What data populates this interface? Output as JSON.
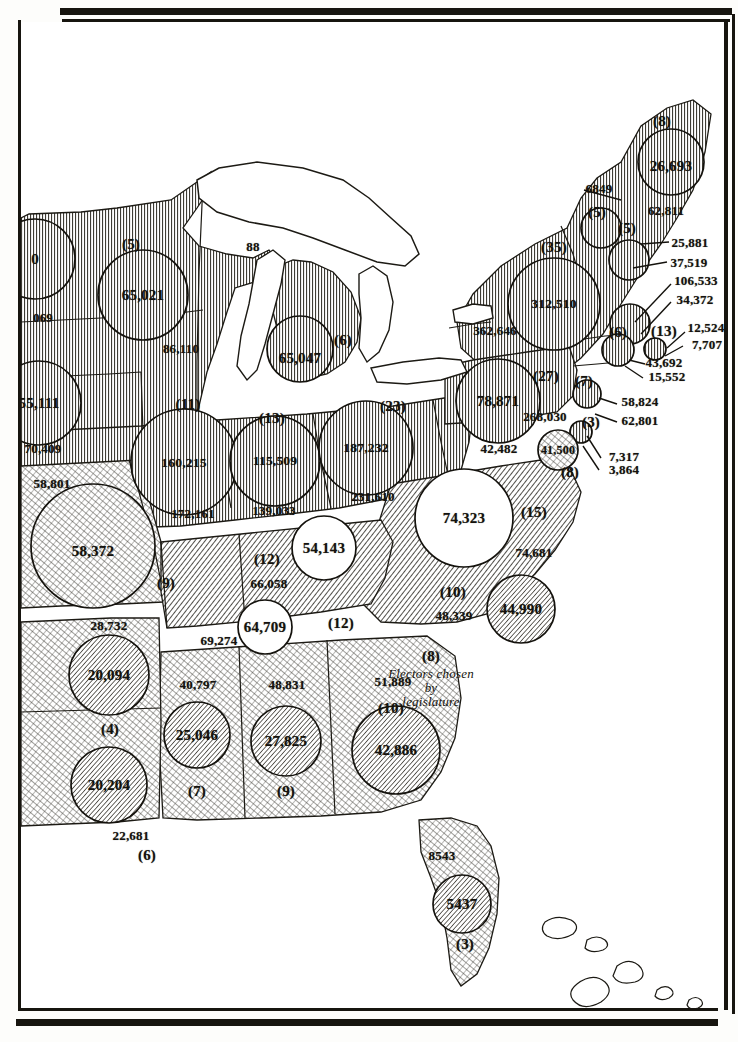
{
  "figure": {
    "type": "thematic-choropleth-proportional-circle-map",
    "region": "Eastern United States"
  },
  "annotation": {
    "south_carolina_note": "Electors chosen\nby\nlegislature"
  },
  "states": [
    {
      "id": "minnesota-partial",
      "circle_value": "0",
      "outside_values": [
        "069"
      ],
      "electors": "",
      "shade": "vertical",
      "cx": 14,
      "cy": 237,
      "r": 40,
      "label_positions": {
        "circle": [
          14,
          237
        ],
        "outside": [
          [
            22,
            295
          ]
        ],
        "electors": [
          0,
          0
        ]
      }
    },
    {
      "id": "wisconsin",
      "circle_value": "65,021",
      "outside_values": [
        "86,110"
      ],
      "electors": "(5)",
      "shade": "vertical",
      "cx": 122,
      "cy": 273,
      "r": 45,
      "label_positions": {
        "circle": [
          122,
          273
        ],
        "outside": [
          [
            160,
            326
          ]
        ],
        "electors": [
          110,
          222
        ]
      }
    },
    {
      "id": "michigan",
      "circle_value": "65,047",
      "outside_values": [],
      "electors": "(6)",
      "shade": "vertical",
      "cx": 279,
      "cy": 327,
      "r": 33,
      "label_positions": {
        "circle": [
          279,
          336
        ],
        "outside": [],
        "electors": [
          322,
          318
        ]
      }
    },
    {
      "id": "michigan-upper-label",
      "circle_value": "",
      "outside_values": [
        "88"
      ],
      "electors": "",
      "shade": "none",
      "cx": 0,
      "cy": 0,
      "r": 0,
      "label_positions": {
        "circle": [
          0,
          0
        ],
        "outside": [
          [
            232,
            224
          ]
        ],
        "electors": [
          0,
          0
        ]
      }
    },
    {
      "id": "iowa",
      "circle_value": "55,111",
      "outside_values": [
        "70,409"
      ],
      "electors": "",
      "shade": "vertical",
      "cx": 18,
      "cy": 381,
      "r": 42,
      "label_positions": {
        "circle": [
          18,
          381
        ],
        "outside": [
          [
            22,
            426
          ]
        ],
        "electors": [
          0,
          0
        ]
      }
    },
    {
      "id": "missouri",
      "circle_value": "58,372",
      "outside_values": [
        "58,801"
      ],
      "electors": "(9)",
      "shade": "cross",
      "cx": 72,
      "cy": 524,
      "r": 62,
      "label_positions": {
        "circle": [
          72,
          529
        ],
        "outside": [
          [
            31,
            461
          ]
        ],
        "electors": [
          145,
          561
        ]
      }
    },
    {
      "id": "illinois",
      "circle_value": "160,215",
      "outside_values": [
        "172,161"
      ],
      "electors": "(11)",
      "shade": "vertical",
      "cx": 163,
      "cy": 440,
      "r": 53,
      "label_positions": {
        "circle": [
          163,
          441
        ],
        "outside": [
          [
            172,
            491
          ]
        ],
        "electors": [
          167,
          382
        ]
      }
    },
    {
      "id": "indiana",
      "circle_value": "115,509",
      "outside_values": [
        "139,033"
      ],
      "electors": "(13)",
      "shade": "vertical",
      "cx": 254,
      "cy": 439,
      "r": 45,
      "label_positions": {
        "circle": [
          254,
          439
        ],
        "outside": [
          [
            253,
            488
          ]
        ],
        "electors": [
          251,
          396
        ]
      }
    },
    {
      "id": "ohio",
      "circle_value": "187,232",
      "outside_values": [
        "231,610"
      ],
      "electors": "(23)",
      "shade": "vertical",
      "cx": 345,
      "cy": 426,
      "r": 47,
      "label_positions": {
        "circle": [
          345,
          426
        ],
        "outside": [
          [
            352,
            474
          ]
        ],
        "electors": [
          372,
          384
        ]
      }
    },
    {
      "id": "pennsylvania",
      "circle_value": "78,871",
      "outside_values": [
        "268,030"
      ],
      "electors": "(27)",
      "shade": "vertical",
      "cx": 477,
      "cy": 379,
      "r": 42,
      "label_positions": {
        "circle": [
          477,
          379
        ],
        "outside": [
          [
            524,
            394
          ]
        ],
        "electors": [
          525,
          354
        ]
      }
    },
    {
      "id": "new-york",
      "circle_value": "312,510",
      "outside_values": [
        "362,646"
      ],
      "electors": "(35)",
      "shade": "vertical",
      "cx": 533,
      "cy": 282,
      "r": 46,
      "label_positions": {
        "circle": [
          533,
          282
        ],
        "outside": [
          [
            474,
            308
          ]
        ],
        "electors": [
          533,
          225
        ]
      }
    },
    {
      "id": "maine",
      "circle_value": "26,693",
      "outside_values": [
        "62,811"
      ],
      "electors": "(8)",
      "shade": "vertical",
      "cx": 650,
      "cy": 140,
      "r": 33,
      "label_positions": {
        "circle": [
          650,
          144
        ],
        "outside": [
          [
            645,
            188
          ]
        ],
        "electors": [
          641,
          99
        ]
      }
    },
    {
      "id": "vermont",
      "circle_value": "",
      "outside_values": [
        "6849"
      ],
      "electors": "(5)",
      "shade": "vertical",
      "cx": 580,
      "cy": 206,
      "r": 20,
      "label_positions": {
        "circle": [
          0,
          0
        ],
        "outside": [
          [
            578,
            166
          ]
        ],
        "electors": [
          576,
          190
        ]
      }
    },
    {
      "id": "new-hampshire",
      "circle_value": "",
      "outside_values": [
        "25,881",
        "37,519"
      ],
      "electors": "(5)",
      "shade": "vertical",
      "cx": 608,
      "cy": 238,
      "r": 20,
      "label_positions": {
        "circle": [
          0,
          0
        ],
        "outside": [
          [
            669,
            220
          ],
          [
            668,
            240
          ]
        ],
        "electors": [
          606,
          206
        ]
      }
    },
    {
      "id": "massachusetts",
      "circle_value": "",
      "outside_values": [
        "106,533",
        "34,372"
      ],
      "electors": "(13)",
      "shade": "vertical",
      "cx": 609,
      "cy": 302,
      "r": 20,
      "label_positions": {
        "circle": [
          0,
          0
        ],
        "outside": [
          [
            675,
            258
          ],
          [
            674,
            277
          ]
        ],
        "electors": [
          643,
          309
        ]
      }
    },
    {
      "id": "rhode-island",
      "circle_value": "",
      "outside_values": [
        "12,524",
        "7,707"
      ],
      "electors": "(4)",
      "shade": "vertical",
      "cx": 634,
      "cy": 327,
      "r": 11,
      "label_positions": {
        "circle": [
          0,
          0
        ],
        "outside": [
          [
            685,
            305
          ],
          [
            686,
            322
          ]
        ],
        "electors": [
          0,
          0
        ]
      }
    },
    {
      "id": "connecticut",
      "circle_value": "",
      "outside_values": [
        "43,692",
        "15,552"
      ],
      "electors": "(6)",
      "shade": "vertical",
      "cx": 597,
      "cy": 328,
      "r": 16,
      "label_positions": {
        "circle": [
          0,
          0
        ],
        "outside": [
          [
            643,
            340
          ],
          [
            646,
            354
          ]
        ],
        "electors": [
          597,
          310
        ]
      }
    },
    {
      "id": "new-jersey",
      "circle_value": "",
      "outside_values": [
        "58,824",
        "62,801"
      ],
      "electors": "(7)",
      "shade": "vertical",
      "cx": 566,
      "cy": 372,
      "r": 14,
      "label_positions": {
        "circle": [
          0,
          0
        ],
        "outside": [
          [
            619,
            379
          ],
          [
            619,
            398
          ]
        ],
        "electors": [
          563,
          359
        ]
      }
    },
    {
      "id": "delaware",
      "circle_value": "",
      "outside_values": [
        "7,317",
        "3,864"
      ],
      "electors": "(3)",
      "shade": "vertical",
      "cx": 560,
      "cy": 410,
      "r": 11,
      "label_positions": {
        "circle": [
          0,
          0
        ],
        "outside": [
          [
            603,
            434
          ],
          [
            603,
            447
          ]
        ],
        "electors": [
          570,
          400
        ]
      }
    },
    {
      "id": "maryland",
      "circle_value": "41,500",
      "outside_values": [
        "42,482"
      ],
      "electors": "(8)",
      "shade": "cross",
      "cx": 537,
      "cy": 428,
      "r": 20,
      "label_positions": {
        "circle": [
          537,
          428
        ],
        "outside": [
          [
            478,
            426
          ]
        ],
        "electors": [
          549,
          450
        ]
      }
    },
    {
      "id": "virginia",
      "circle_value": "74,323",
      "outside_values": [
        "74,681"
      ],
      "electors": "(15)",
      "shade": "none",
      "cx": 443,
      "cy": 496,
      "r": 49,
      "label_positions": {
        "circle": [
          443,
          496
        ],
        "outside": [
          [
            513,
            530
          ]
        ],
        "electors": [
          513,
          490
        ]
      }
    },
    {
      "id": "kentucky",
      "circle_value": "54,143",
      "outside_values": [
        "66,058"
      ],
      "electors": "(12)",
      "shade": "none",
      "cx": 303,
      "cy": 526,
      "r": 32,
      "label_positions": {
        "circle": [
          303,
          526
        ],
        "outside": [
          [
            248,
            561
          ]
        ],
        "electors": [
          246,
          537
        ]
      }
    },
    {
      "id": "tennessee",
      "circle_value": "64,709",
      "outside_values": [
        "69,274"
      ],
      "electors": "(12)",
      "shade": "none",
      "cx": 244,
      "cy": 605,
      "r": 27,
      "label_positions": {
        "circle": [
          244,
          605
        ],
        "outside": [
          [
            198,
            618
          ]
        ],
        "electors": [
          320,
          601
        ]
      }
    },
    {
      "id": "north-carolina",
      "circle_value": "44,990",
      "outside_values": [
        "48,339"
      ],
      "electors": "(10)",
      "shade": "cross",
      "cx": 500,
      "cy": 587,
      "r": 34,
      "label_positions": {
        "circle": [
          500,
          587
        ],
        "outside": [
          [
            433,
            593
          ]
        ],
        "electors": [
          432,
          570
        ]
      }
    },
    {
      "id": "south-carolina",
      "circle_value": "",
      "outside_values": [],
      "electors": "(8)",
      "shade": "none",
      "cx": 0,
      "cy": 0,
      "r": 0,
      "label_positions": {
        "circle": [
          0,
          0
        ],
        "outside": [],
        "electors": [
          410,
          634
        ]
      }
    },
    {
      "id": "georgia",
      "circle_value": "42,886",
      "outside_values": [
        "51,889"
      ],
      "electors": "(10)",
      "shade": "cross",
      "cx": 375,
      "cy": 728,
      "r": 44,
      "label_positions": {
        "circle": [
          375,
          728
        ],
        "outside": [
          [
            372,
            659
          ]
        ],
        "electors": [
          370,
          686
        ]
      }
    },
    {
      "id": "alabama",
      "circle_value": "25,046",
      "outside_values": [
        "40,797"
      ],
      "electors": "(7)",
      "shade": "cross",
      "cx": 176,
      "cy": 713,
      "r": 33,
      "label_positions": {
        "circle": [
          176,
          713
        ],
        "outside": [
          [
            177,
            662
          ]
        ],
        "electors": [
          176,
          769
        ]
      }
    },
    {
      "id": "mississippi",
      "circle_value": "27,825",
      "outside_values": [
        "48,831"
      ],
      "electors": "(9)",
      "shade": "cross",
      "cx": 265,
      "cy": 719,
      "r": 35,
      "label_positions": {
        "circle": [
          265,
          719
        ],
        "outside": [
          [
            266,
            662
          ]
        ],
        "electors": [
          265,
          769
        ]
      }
    },
    {
      "id": "arkansas",
      "circle_value": "20,094",
      "outside_values": [
        "28,732"
      ],
      "electors": "(4)",
      "shade": "cross",
      "cx": 88,
      "cy": 653,
      "r": 40,
      "label_positions": {
        "circle": [
          88,
          653
        ],
        "outside": [
          [
            88,
            603
          ]
        ],
        "electors": [
          89,
          707
        ]
      }
    },
    {
      "id": "louisiana",
      "circle_value": "20,204",
      "outside_values": [
        "22,681"
      ],
      "electors": "(6)",
      "shade": "cross",
      "cx": 88,
      "cy": 763,
      "r": 38,
      "label_positions": {
        "circle": [
          88,
          763
        ],
        "outside": [
          [
            110,
            813
          ]
        ],
        "electors": [
          126,
          833
        ]
      }
    },
    {
      "id": "florida",
      "circle_value": "5437",
      "outside_values": [
        "8543"
      ],
      "electors": "(3)",
      "shade": "cross",
      "cx": 441,
      "cy": 882,
      "r": 29,
      "label_positions": {
        "circle": [
          441,
          882
        ],
        "outside": [
          [
            421,
            833
          ]
        ],
        "electors": [
          444,
          922
        ]
      }
    }
  ]
}
